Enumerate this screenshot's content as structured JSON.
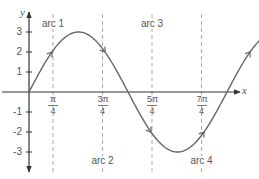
{
  "chart_data": {
    "type": "line",
    "title": "",
    "function": "y = 3 sin(2x)",
    "xlabel": "x",
    "ylabel": "y",
    "x_range": [
      0,
      6.6
    ],
    "ylim": [
      -3.6,
      3.6
    ],
    "grid": false,
    "legend": null,
    "x_ticks": [
      {
        "label_num": "π",
        "label_den": "4",
        "value": 0.7854
      },
      {
        "label_num": "3π",
        "label_den": "4",
        "value": 2.3562
      },
      {
        "label_num": "5π",
        "label_den": "4",
        "value": 3.927
      },
      {
        "label_num": "7π",
        "label_den": "4",
        "value": 5.4978
      }
    ],
    "y_ticks": [
      "3",
      "2",
      "1",
      "-1",
      "-2",
      "-3"
    ],
    "y_tick_values": [
      3,
      2,
      1,
      -1,
      -2,
      -3
    ],
    "reference_lines": {
      "style": "dashed",
      "x": [
        0.7854,
        2.3562,
        3.927,
        5.4978
      ]
    },
    "series": [
      {
        "name": "3sin(2x)",
        "x": [
          0,
          0.3927,
          0.7854,
          1.1781,
          1.5708,
          1.9635,
          2.3562,
          2.7489,
          3.1416,
          3.5343,
          3.927,
          4.3197,
          4.7124,
          5.1051,
          5.4978,
          5.8905,
          6.2832
        ],
        "values": [
          0,
          2.12,
          3,
          2.12,
          0,
          -2.12,
          -3,
          -2.12,
          0,
          2.12,
          3,
          2.12,
          0,
          -2.12,
          -3,
          -2.12,
          0
        ]
      }
    ],
    "annotations": [
      {
        "text": "arc 1",
        "x": 0.7854,
        "y": 3,
        "position": "above"
      },
      {
        "text": "arc 2",
        "x": 2.3562,
        "y": -3,
        "position": "below"
      },
      {
        "text": "arc 3",
        "x": 3.927,
        "y": 3,
        "position": "above"
      },
      {
        "text": "arc 4",
        "x": 5.4978,
        "y": -3,
        "position": "below"
      }
    ],
    "direction_arrows": "arrowheads along the curve indicate increasing x"
  },
  "labels": {
    "y_axis": "y",
    "x_axis": "x",
    "y_ticks": [
      "3",
      "2",
      "1",
      "-1",
      "-2",
      "-3"
    ],
    "x_ticks": [
      {
        "num": "π",
        "den": "4"
      },
      {
        "num": "3π",
        "den": "4"
      },
      {
        "num": "5π",
        "den": "4"
      },
      {
        "num": "7π",
        "den": "4"
      }
    ],
    "arcs": [
      "arc 1",
      "arc 2",
      "arc 3",
      "arc 4"
    ]
  },
  "colors": {
    "axis": "#333333",
    "curve": "#666666",
    "dashed": "#aaaaaa",
    "text": "#555555"
  }
}
